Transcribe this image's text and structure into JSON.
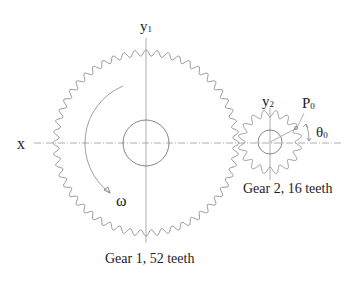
{
  "diagram": {
    "axes": {
      "x_label": "x",
      "y1_label": "y",
      "y1_sub": "1",
      "y2_label": "y",
      "y2_sub": "2"
    },
    "gear1": {
      "label": "Gear 1, 52 teeth",
      "teeth": 52,
      "center": [
        146,
        143
      ],
      "tip_radius": 93,
      "root_radius": 87,
      "hub_radius": 23
    },
    "gear2": {
      "label": "Gear 2, 16 teeth",
      "teeth": 16,
      "center": [
        270,
        142
      ],
      "tip_radius": 32,
      "root_radius": 25,
      "hub_radius": 12
    },
    "annotations": {
      "omega": "ω",
      "point_label": "P",
      "point_sub": "0",
      "angle_label": "θ",
      "angle_sub": "0"
    },
    "colors": {
      "gear_stroke": "#8a8a8a",
      "axis_stroke": "#9a9a9a",
      "text": "#222222"
    }
  }
}
